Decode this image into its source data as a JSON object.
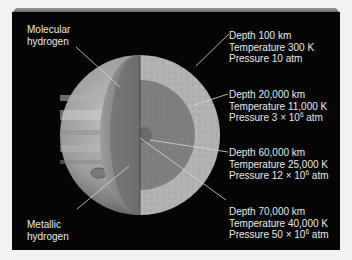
{
  "diagram": {
    "left_labels": [
      {
        "id": "molecular",
        "lines": [
          "Molecular",
          "hydrogen"
        ]
      },
      {
        "id": "metallic",
        "lines": [
          "Metallic",
          "hydrogen"
        ]
      }
    ],
    "right_labels": [
      {
        "depth": "Depth 100 km",
        "temperature": "Temperature 300 K",
        "pressure_prefix": "Pressure 10 atm",
        "pressure_exp": "",
        "pressure_suffix": ""
      },
      {
        "depth": "Depth 20,000 km",
        "temperature": "Temperature 11,000 K",
        "pressure_prefix": "Pressure 3 × 10",
        "pressure_exp": "6",
        "pressure_suffix": " atm"
      },
      {
        "depth": "Depth 60,000 km",
        "temperature": "Temperature 25,000 K",
        "pressure_prefix": "Pressure 12 × 10",
        "pressure_exp": "6",
        "pressure_suffix": " atm"
      },
      {
        "depth": "Depth 70,000 km",
        "temperature": "Temperature 40,000 K",
        "pressure_prefix": "Pressure 50 × 10",
        "pressure_exp": "6",
        "pressure_suffix": " atm"
      }
    ],
    "colors": {
      "background": "#050505",
      "outer_layer": "#a8a8a8",
      "inner_layer": "#7c7c7c",
      "core": "#6a6a6a",
      "text": "#e8e8e8",
      "leader_line": "#d8d8d8"
    }
  }
}
